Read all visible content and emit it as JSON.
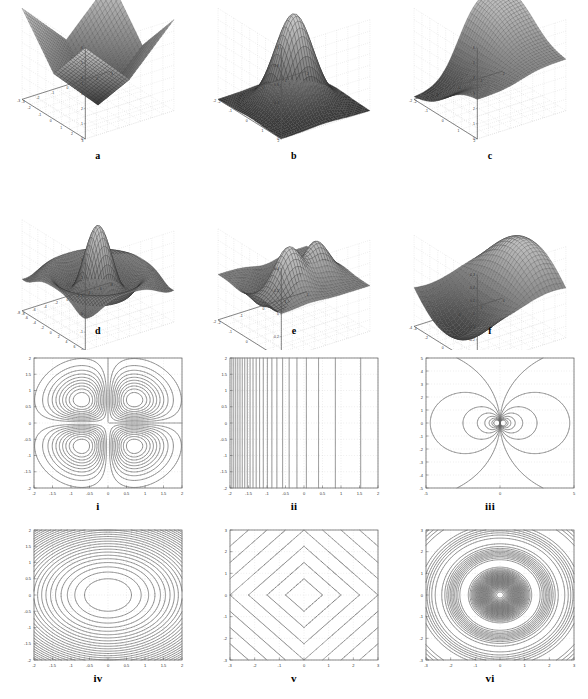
{
  "figure": {
    "title": "",
    "layout": {
      "rows": 4,
      "cols": 3,
      "width": 588,
      "height": 699
    }
  },
  "panels": [
    {
      "id": "a",
      "caption": "a",
      "kind": "surface"
    },
    {
      "id": "b",
      "caption": "b",
      "kind": "surface"
    },
    {
      "id": "c",
      "caption": "c",
      "kind": "surface"
    },
    {
      "id": "d",
      "caption": "d",
      "kind": "surface"
    },
    {
      "id": "e",
      "caption": "e",
      "kind": "surface"
    },
    {
      "id": "f",
      "caption": "f",
      "kind": "surface"
    },
    {
      "id": "i",
      "caption": "i",
      "kind": "contour"
    },
    {
      "id": "ii",
      "caption": "ii",
      "kind": "contour"
    },
    {
      "id": "iii",
      "caption": "iii",
      "kind": "contour"
    },
    {
      "id": "iv",
      "caption": "iv",
      "kind": "contour"
    },
    {
      "id": "v",
      "caption": "v",
      "kind": "contour"
    },
    {
      "id": "vi",
      "caption": "vi",
      "kind": "contour"
    }
  ],
  "chart_data": [
    {
      "panel": "a",
      "type": "surface",
      "title": "a",
      "surface": "abs_bowl",
      "expression": "z = |x| + |y|",
      "xlabel": "",
      "ylabel": "",
      "zlabel": "",
      "xlim": [
        -3,
        3
      ],
      "ylim": [
        -3,
        3
      ],
      "zlim": [
        0,
        6
      ],
      "xticks": [
        -3,
        -2,
        -1,
        0,
        1,
        2,
        3
      ],
      "yticks": [
        -3,
        -2,
        -1,
        0,
        1,
        2,
        3
      ],
      "zticks": [
        0,
        1,
        2,
        3,
        4,
        5,
        6
      ],
      "grid": true,
      "mesh": true,
      "legend": "none",
      "mesh_n": 30
    },
    {
      "panel": "b",
      "type": "surface",
      "title": "b",
      "surface": "gaussian",
      "expression": "z = exp(-(x^2 + y^2))",
      "xlabel": "",
      "ylabel": "",
      "zlabel": "",
      "xlim": [
        -2,
        2
      ],
      "ylim": [
        -2,
        2
      ],
      "zlim": [
        0,
        1
      ],
      "xticks": [
        -2,
        -1,
        0,
        1,
        2
      ],
      "yticks": [
        -2,
        -1,
        0,
        1,
        2
      ],
      "zticks": [
        0,
        0.2,
        0.4,
        0.6,
        0.8,
        1
      ],
      "grid": true,
      "mesh": true,
      "legend": "none",
      "mesh_n": 34
    },
    {
      "panel": "c",
      "type": "surface",
      "title": "c",
      "surface": "ramp_step",
      "expression": "z = ramp / saturating step in x",
      "xlabel": "",
      "ylabel": "",
      "zlabel": "",
      "xlim": [
        -2,
        2
      ],
      "ylim": [
        -2,
        2
      ],
      "zlim": [
        0,
        6
      ],
      "xticks": [
        -2,
        -1,
        0,
        1,
        2
      ],
      "yticks": [
        -2,
        -1,
        0,
        1,
        2
      ],
      "zticks": [
        0,
        1,
        2,
        3,
        4,
        5,
        6
      ],
      "grid": true,
      "mesh": true,
      "legend": "none",
      "mesh_n": 30
    },
    {
      "panel": "d",
      "type": "surface",
      "title": "d",
      "surface": "sombrero",
      "expression": "z = sin(r)/r  (sinc ripple)",
      "xlabel": "",
      "ylabel": "",
      "zlabel": "",
      "xlim": [
        -8,
        8
      ],
      "ylim": [
        -8,
        8
      ],
      "zlim": [
        -2,
        3
      ],
      "xticks": [
        -8,
        -6,
        -4,
        -2,
        0,
        2,
        4,
        6,
        8
      ],
      "yticks": [
        -8,
        -6,
        -4,
        -2,
        0,
        2,
        4,
        6,
        8
      ],
      "zticks": [
        -2,
        -1,
        0,
        1,
        2,
        3
      ],
      "grid": true,
      "mesh": true,
      "legend": "none",
      "mesh_n": 44
    },
    {
      "panel": "e",
      "type": "surface",
      "title": "e",
      "surface": "peaks",
      "expression": "z = peaks-like multi-bump surface",
      "xlabel": "",
      "ylabel": "",
      "zlabel": "",
      "xlim": [
        -2,
        2
      ],
      "ylim": [
        -2,
        2
      ],
      "zlim": [
        -0.4,
        0.4
      ],
      "xticks": [
        -2,
        -1,
        0,
        1,
        2
      ],
      "yticks": [
        -2,
        -1,
        0,
        1,
        2
      ],
      "zticks": [
        -0.4,
        -0.2,
        0,
        0.2,
        0.4
      ],
      "grid": true,
      "mesh": true,
      "legend": "none",
      "mesh_n": 32
    },
    {
      "panel": "f",
      "type": "surface",
      "title": "f",
      "surface": "saddle_wave",
      "expression": "z = smooth saddle / single sine wave",
      "xlabel": "",
      "ylabel": "",
      "zlabel": "",
      "xlim": [
        -4,
        4
      ],
      "ylim": [
        -4,
        4
      ],
      "zlim": [
        -0.4,
        0.3
      ],
      "xticks": [
        -4,
        -2,
        0,
        2,
        4
      ],
      "yticks": [
        -4,
        -2,
        0,
        2,
        4
      ],
      "zticks": [
        -0.4,
        -0.3,
        -0.2,
        -0.1,
        0,
        0.1,
        0.2,
        0.3
      ],
      "grid": true,
      "mesh": true,
      "legend": "none",
      "mesh_n": 26
    },
    {
      "panel": "i",
      "type": "contour",
      "title": "i",
      "field": "quadrupole",
      "expression": "z = x*y*exp(-(x^2+y^2))",
      "xlabel": "",
      "ylabel": "",
      "xlim": [
        -2,
        2
      ],
      "ylim": [
        -2,
        2
      ],
      "xticks": [
        -2,
        -1.5,
        -1,
        -0.5,
        0,
        0.5,
        1,
        1.5,
        2
      ],
      "yticks": [
        -2,
        -1.5,
        -1,
        -0.5,
        0,
        0.5,
        1,
        1.5,
        2
      ],
      "xticklabels": [
        "-2",
        "-1.5",
        "-1",
        "-0.5",
        "0",
        "0.5",
        "1",
        "1.5",
        "2"
      ],
      "yticklabels": [
        "-2",
        "-1.5",
        "-1",
        "-0.5",
        "0",
        "0.5",
        "1",
        "1.5",
        "2"
      ],
      "n_levels": 22,
      "grid": true,
      "legend": "none"
    },
    {
      "panel": "ii",
      "type": "contour",
      "title": "ii",
      "field": "exponential_x",
      "expression": "z = exp(-x)  (vertical contours)",
      "xlabel": "",
      "ylabel": "",
      "xlim": [
        -2,
        2
      ],
      "ylim": [
        -2,
        2
      ],
      "xticks": [
        -2,
        -1.5,
        -1,
        -0.5,
        0,
        0.5,
        1,
        1.5,
        2
      ],
      "yticks": [
        -2,
        -1.5,
        -1,
        -0.5,
        0,
        0.5,
        1,
        1.5,
        2
      ],
      "xticklabels": [
        "-2",
        "-1.5",
        "-1",
        "-0.5",
        "0",
        "0.5",
        "1",
        "1.5",
        "2"
      ],
      "yticklabels": [
        "-2",
        "-1.5",
        "-1",
        "-0.5",
        "0",
        "0.5",
        "1",
        "1.5",
        "2"
      ],
      "n_levels": 24,
      "grid": true,
      "legend": "none"
    },
    {
      "panel": "iii",
      "type": "contour",
      "title": "iii",
      "field": "dipole",
      "expression": "z = x / (x^2 + y^2)",
      "xlabel": "",
      "ylabel": "",
      "xlim": [
        -5,
        5
      ],
      "ylim": [
        -5,
        5
      ],
      "xticks": [
        -5,
        0,
        5
      ],
      "yticks": [
        -5,
        -4,
        -3,
        -2,
        -1,
        0,
        1,
        2,
        3,
        4,
        5
      ],
      "xticklabels": [
        "-5",
        "0",
        "5"
      ],
      "yticklabels": [
        "-5",
        "-4",
        "-3",
        "-2",
        "-1",
        "0",
        "1",
        "2",
        "3",
        "4",
        "5"
      ],
      "n_levels": 20,
      "grid": true,
      "legend": "none"
    },
    {
      "panel": "iv",
      "type": "contour",
      "field": "elliptic_bowl",
      "title": "iv",
      "expression": "z = x^2/a^2 + y^2/b^2 (concentric ellipses)",
      "xlabel": "",
      "ylabel": "",
      "xlim": [
        -2,
        2
      ],
      "ylim": [
        -2,
        2
      ],
      "xticks": [
        -2,
        -1.5,
        -1,
        -0.5,
        0,
        0.5,
        1,
        1.5,
        2
      ],
      "yticks": [
        -2,
        -1.5,
        -1,
        -0.5,
        0,
        0.5,
        1,
        1.5,
        2
      ],
      "xticklabels": [
        "-2",
        "-1.5",
        "-1",
        "-0.5",
        "0",
        "0.5",
        "1",
        "1.5",
        "2"
      ],
      "yticklabels": [
        "-2",
        "-1.5",
        "-1",
        "-0.5",
        "0",
        "0.5",
        "1",
        "1.5",
        "2"
      ],
      "n_levels": 26,
      "grid": true,
      "legend": "none"
    },
    {
      "panel": "v",
      "type": "contour",
      "title": "v",
      "field": "l1_norm",
      "expression": "z = |x| + |y|  (diamond contours)",
      "xlabel": "",
      "ylabel": "",
      "xlim": [
        -3,
        3
      ],
      "ylim": [
        -3,
        3
      ],
      "xticks": [
        -3,
        -2,
        -1,
        0,
        1,
        2,
        3
      ],
      "yticks": [
        -3,
        -2,
        -1,
        0,
        1,
        2,
        3
      ],
      "xticklabels": [
        "-3",
        "-2",
        "-1",
        "0",
        "1",
        "2",
        "3"
      ],
      "yticklabels": [
        "-3",
        "-2",
        "-1",
        "0",
        "1",
        "2",
        "3"
      ],
      "n_levels": 8,
      "grid": true,
      "legend": "none"
    },
    {
      "panel": "vi",
      "type": "contour",
      "title": "vi",
      "field": "radial_ripple",
      "expression": "z = sin(k*r)/r  (concentric ripple rings)",
      "xlabel": "",
      "ylabel": "",
      "xlim": [
        -3,
        3
      ],
      "ylim": [
        -3,
        3
      ],
      "xticks": [
        -3,
        -2,
        -1,
        0,
        1,
        2,
        3
      ],
      "yticks": [
        -3,
        -2,
        -1,
        0,
        1,
        2,
        3
      ],
      "xticklabels": [
        "-3",
        "-2",
        "-1",
        "0",
        "1",
        "2",
        "3"
      ],
      "yticklabels": [
        "-3",
        "-2",
        "-1",
        "0",
        "1",
        "2",
        "3"
      ],
      "n_levels": 40,
      "grid": true,
      "legend": "none"
    }
  ],
  "colors": {
    "axis": "#555555",
    "grid": "#bbbbbb",
    "mesh": "#444444",
    "mesh_fill": "#9a9a9a",
    "mesh_fill_dark": "#3a3a3a",
    "contour": "#666666",
    "caption": "#000000",
    "background": "#ffffff"
  }
}
